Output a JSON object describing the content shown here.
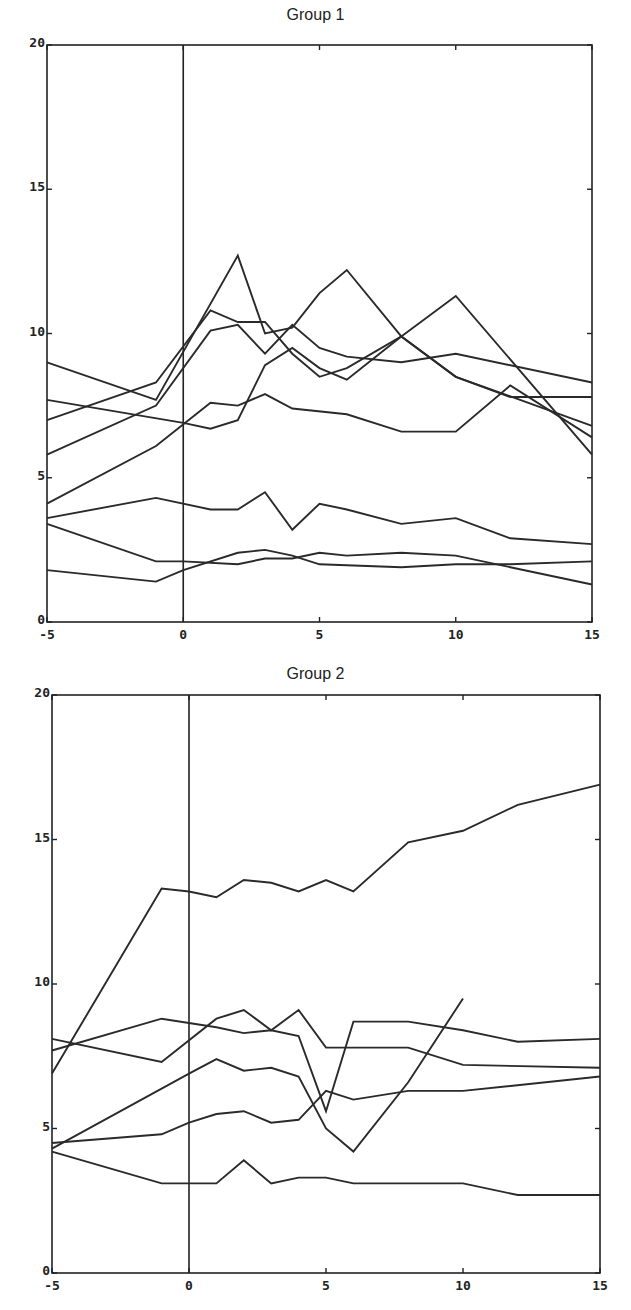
{
  "chart_data": [
    {
      "type": "line",
      "title": "Group 1",
      "xlabel": "",
      "ylabel": "",
      "xlim": [
        -5,
        15
      ],
      "ylim": [
        0,
        20
      ],
      "xticks": [
        -5,
        0,
        5,
        10,
        15
      ],
      "yticks": [
        0,
        5,
        10,
        15,
        20
      ],
      "vertical_reference_line_x": 0,
      "grid": false,
      "legend": null,
      "series": [
        {
          "name": "subject 1",
          "x": [
            -5,
            -1,
            1,
            2,
            3,
            4,
            5,
            6,
            8,
            10,
            15
          ],
          "y": [
            7.0,
            8.3,
            10.8,
            10.4,
            10.4,
            9.3,
            8.5,
            8.8,
            9.9,
            8.5,
            6.8
          ]
        },
        {
          "name": "subject 2",
          "x": [
            -5,
            -1,
            2,
            3,
            4,
            5,
            6,
            8,
            10,
            15
          ],
          "y": [
            9.0,
            7.7,
            12.7,
            10.0,
            10.2,
            11.4,
            12.2,
            9.9,
            11.3,
            5.8
          ]
        },
        {
          "name": "subject 3",
          "x": [
            -5,
            -1,
            1,
            2,
            3,
            4,
            5,
            6,
            8,
            10,
            15
          ],
          "y": [
            5.8,
            7.5,
            10.1,
            10.3,
            9.3,
            10.3,
            9.5,
            9.2,
            9.0,
            9.3,
            8.3
          ]
        },
        {
          "name": "subject 4",
          "x": [
            -5,
            0,
            1,
            2,
            3,
            4,
            5,
            6,
            8,
            10,
            12,
            15
          ],
          "y": [
            7.7,
            6.9,
            6.7,
            7.0,
            8.9,
            9.5,
            8.8,
            8.4,
            9.9,
            8.5,
            7.8,
            7.8
          ]
        },
        {
          "name": "subject 5",
          "x": [
            -5,
            -1,
            1,
            2,
            3,
            4,
            6,
            8,
            10,
            12,
            15
          ],
          "y": [
            4.1,
            6.1,
            7.6,
            7.5,
            7.9,
            7.4,
            7.2,
            6.6,
            6.6,
            8.2,
            6.4
          ]
        },
        {
          "name": "subject 6",
          "x": [
            -5,
            -1,
            1,
            2,
            3,
            4,
            5,
            6,
            8,
            10,
            12,
            15
          ],
          "y": [
            3.6,
            4.3,
            3.9,
            3.9,
            4.5,
            3.2,
            4.1,
            3.9,
            3.4,
            3.6,
            2.9,
            2.7
          ]
        },
        {
          "name": "subject 7",
          "x": [
            -5,
            -1,
            0,
            2,
            3,
            4,
            5,
            6,
            8,
            10,
            12,
            15
          ],
          "y": [
            3.4,
            2.1,
            2.1,
            2.0,
            2.2,
            2.2,
            2.4,
            2.3,
            2.4,
            2.3,
            1.9,
            1.3
          ]
        },
        {
          "name": "subject 8",
          "x": [
            -5,
            -1,
            0,
            2,
            3,
            4,
            5,
            8,
            10,
            12,
            15
          ],
          "y": [
            1.8,
            1.4,
            1.8,
            2.4,
            2.5,
            2.3,
            2.0,
            1.9,
            2.0,
            2.0,
            2.1
          ]
        }
      ]
    },
    {
      "type": "line",
      "title": "Group 2",
      "xlabel": "",
      "ylabel": "",
      "xlim": [
        -5,
        15
      ],
      "ylim": [
        0,
        20
      ],
      "xticks": [
        -5,
        0,
        5,
        10,
        15
      ],
      "yticks": [
        0,
        5,
        10,
        15,
        20
      ],
      "vertical_reference_line_x": 0,
      "grid": false,
      "legend": null,
      "series": [
        {
          "name": "subject 1",
          "x": [
            -5,
            -1,
            0,
            1,
            2,
            3,
            4,
            5,
            6,
            8,
            10,
            12,
            15
          ],
          "y": [
            6.9,
            13.3,
            13.2,
            13.0,
            13.6,
            13.5,
            13.2,
            13.6,
            13.2,
            14.9,
            15.3,
            16.2,
            16.9
          ]
        },
        {
          "name": "subject 2",
          "x": [
            -5,
            -1,
            1,
            2,
            3,
            4,
            5,
            6,
            8,
            10,
            12,
            15
          ],
          "y": [
            7.7,
            8.8,
            8.5,
            8.3,
            8.4,
            8.2,
            5.6,
            8.7,
            8.7,
            8.4,
            8.0,
            8.1
          ]
        },
        {
          "name": "subject 3",
          "x": [
            -5,
            -1,
            1,
            2,
            3,
            4,
            5,
            6,
            8,
            10,
            15
          ],
          "y": [
            8.1,
            7.3,
            8.8,
            9.1,
            8.4,
            9.1,
            7.8,
            7.8,
            7.8,
            7.2,
            7.1
          ]
        },
        {
          "name": "subject 4",
          "x": [
            -5,
            0,
            1,
            2,
            3,
            4,
            5,
            6,
            8,
            10
          ],
          "y": [
            4.3,
            6.9,
            7.4,
            7.0,
            7.1,
            6.8,
            5.0,
            4.2,
            6.6,
            9.5
          ]
        },
        {
          "name": "subject 5",
          "x": [
            -5,
            -1,
            0,
            1,
            2,
            3,
            4,
            5,
            6,
            8,
            10,
            15
          ],
          "y": [
            4.5,
            4.8,
            5.2,
            5.5,
            5.6,
            5.2,
            5.3,
            6.3,
            6.0,
            6.3,
            6.3,
            6.8
          ]
        },
        {
          "name": "subject 6",
          "x": [
            -5,
            -1,
            1,
            2,
            3,
            4,
            5,
            6,
            8,
            10,
            12,
            15
          ],
          "y": [
            4.2,
            3.1,
            3.1,
            3.9,
            3.1,
            3.3,
            3.3,
            3.1,
            3.1,
            3.1,
            2.7,
            2.7
          ]
        }
      ]
    }
  ],
  "panels": [
    {
      "title": "Group 1",
      "x_tick_labels": [
        "-5",
        "0",
        "5",
        "10",
        "15"
      ],
      "y_tick_labels": [
        "0",
        "5",
        "10",
        "15",
        "20"
      ]
    },
    {
      "title": "Group 2",
      "x_tick_labels": [
        "-5",
        "0",
        "5",
        "10",
        "15"
      ],
      "y_tick_labels": [
        "0",
        "5",
        "10",
        "15",
        "20"
      ]
    }
  ]
}
